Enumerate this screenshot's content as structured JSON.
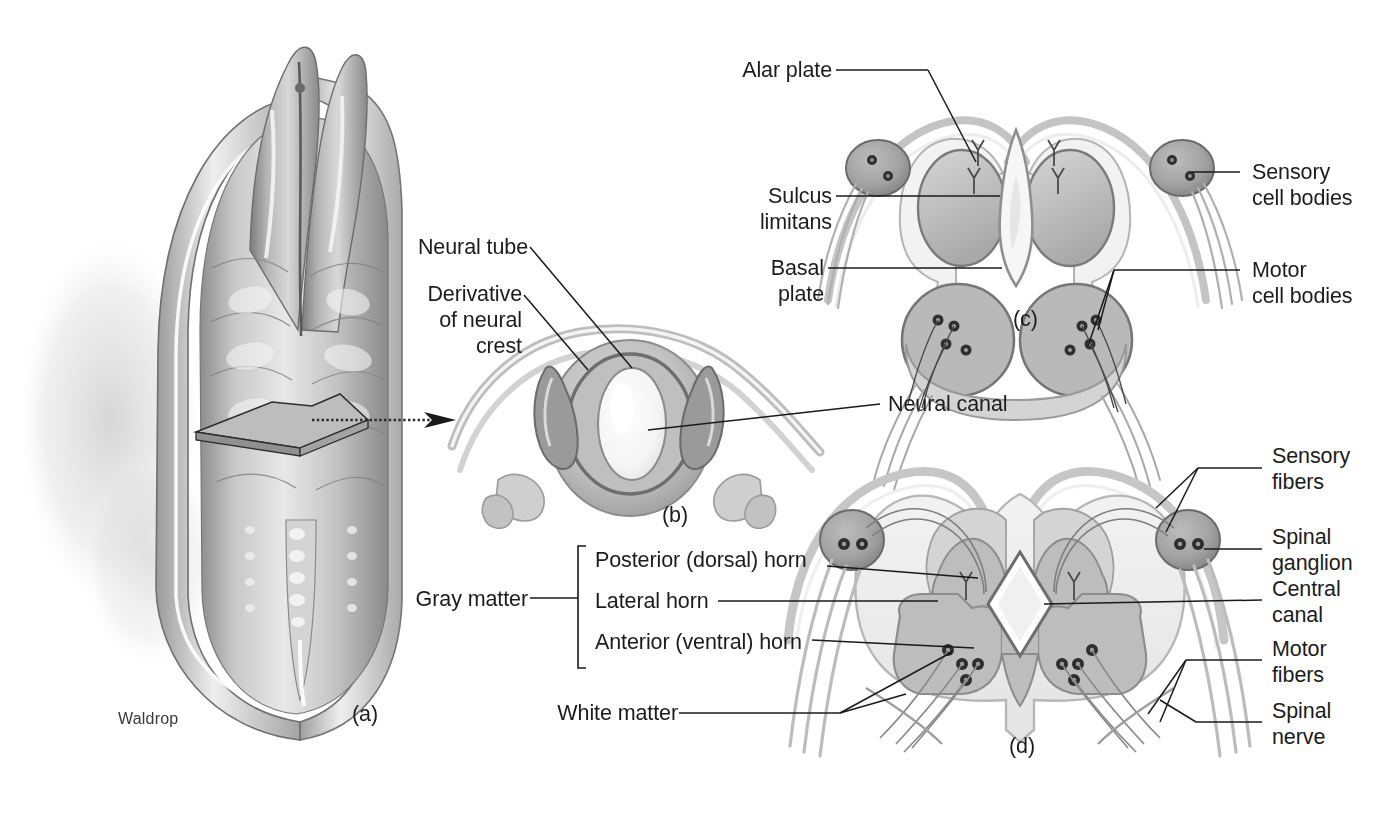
{
  "figure": {
    "signature": "Waldrop",
    "panel_ids": {
      "a": "(a)",
      "b": "(b)",
      "c": "(c)",
      "d": "(d)"
    }
  },
  "panel_a": {
    "id": "(a)",
    "description": "dorsal view of embryo showing neural groove and somites with a cut plane",
    "signature": "Waldrop"
  },
  "panel_b": {
    "id": "(b)",
    "labels": {
      "neural_tube": "Neural tube",
      "derivative_of_neural_crest": "Derivative\nof neural\ncrest",
      "neural_canal": "Neural canal"
    }
  },
  "panel_c": {
    "id": "(c)",
    "labels": {
      "alar_plate": "Alar plate",
      "sulcus_limitans": "Sulcus\nlimitans",
      "basal_plate": "Basal\nplate",
      "sensory_cell_bodies": "Sensory\ncell bodies",
      "motor_cell_bodies": "Motor\ncell bodies"
    }
  },
  "panel_d": {
    "id": "(d)",
    "labels": {
      "gray_matter": "Gray matter",
      "posterior_horn": "Posterior (dorsal) horn",
      "lateral_horn": "Lateral horn",
      "anterior_horn": "Anterior (ventral) horn",
      "white_matter": "White matter",
      "sensory_fibers": "Sensory\nfibers",
      "spinal_ganglion": "Spinal\nganglion",
      "central_canal": "Central\ncanal",
      "motor_fibers": "Motor\nfibers",
      "spinal_nerve": "Spinal\nnerve"
    }
  },
  "colors": {
    "background": "#ffffff",
    "ink": "#1c1c1c",
    "leader_line": "#1a1a1a",
    "tone_lightest": "#f0f0f0",
    "tone_light": "#e2e2e2",
    "tone_mid": "#c9c9c9",
    "tone_mid_dark": "#b0b0b0",
    "tone_dark": "#8e8e8e",
    "tone_darkest": "#6a6a6a",
    "outline": "#555555"
  }
}
